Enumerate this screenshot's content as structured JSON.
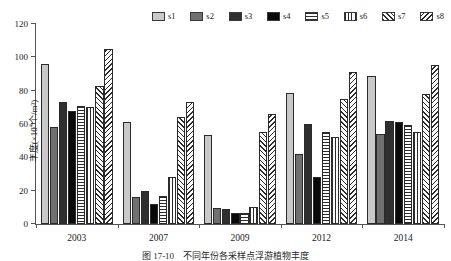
{
  "chart_data": {
    "type": "bar",
    "title": "",
    "caption": "图 17-10　不同年份各采样点浮游植物丰度",
    "xlabel": "",
    "ylabel": "丰度(×10⁴个/m³)",
    "ylabel_prefix": "丰度(×10",
    "ylabel_exp": "4",
    "ylabel_suffix": "个/m³)",
    "categories": [
      "2003",
      "2007",
      "2009",
      "2012",
      "2014"
    ],
    "ylim": [
      0,
      120
    ],
    "yticks": [
      0,
      20,
      40,
      60,
      80,
      100,
      120
    ],
    "ytick_labels": [
      "0",
      "20",
      "40",
      "60",
      "80",
      "100",
      "120"
    ],
    "grid": false,
    "legend_position": "top-right",
    "series": [
      {
        "name": "s1",
        "fill": "solid-light-gray",
        "color": "#c9c9c9",
        "values": [
          96.0,
          61.0,
          53.5,
          78.5,
          89.0
        ]
      },
      {
        "name": "s2",
        "fill": "solid-mid-gray",
        "color": "#707070",
        "values": [
          58.0,
          16.0,
          9.5,
          42.0,
          54.0
        ]
      },
      {
        "name": "s3",
        "fill": "solid-dark-gray",
        "color": "#2f2f2f",
        "values": [
          73.0,
          20.0,
          9.0,
          60.0,
          62.0
        ]
      },
      {
        "name": "s4",
        "fill": "solid-black",
        "color": "#0a0a0a",
        "values": [
          68.0,
          12.0,
          6.5,
          28.0,
          61.0
        ]
      },
      {
        "name": "s5",
        "fill": "horizontal-lines",
        "color": "#ffffff",
        "values": [
          71.0,
          17.0,
          6.5,
          55.0,
          59.5
        ]
      },
      {
        "name": "s6",
        "fill": "vertical-lines",
        "color": "#ffffff",
        "values": [
          70.0,
          28.5,
          10.0,
          52.0,
          55.5
        ]
      },
      {
        "name": "s7",
        "fill": "diagonal-forward",
        "color": "#ffffff",
        "values": [
          83.0,
          64.0,
          55.0,
          75.0,
          78.0
        ]
      },
      {
        "name": "s8",
        "fill": "diagonal-backward",
        "color": "#ffffff",
        "values": [
          105.0,
          73.0,
          66.0,
          91.0,
          95.5
        ]
      }
    ]
  },
  "legend": {
    "items": [
      {
        "label": "s1"
      },
      {
        "label": "s2"
      },
      {
        "label": "s3"
      },
      {
        "label": "s4"
      },
      {
        "label": "s5"
      },
      {
        "label": "s6"
      },
      {
        "label": "s7"
      },
      {
        "label": "s8"
      }
    ]
  },
  "colors": {
    "axis": "#555555",
    "text": "#1a1a1a",
    "background": "#ffffff"
  }
}
